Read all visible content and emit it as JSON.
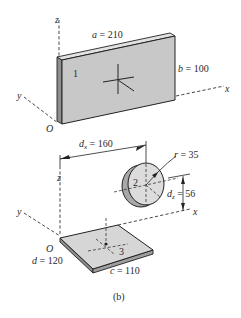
{
  "figure": {
    "caption": "(b)",
    "colors": {
      "plate_face": "#c8c8c8",
      "plate_edge": "#8e8e8e",
      "plate_top": "#e2e2e2",
      "disk_face": "#dcdcdc",
      "disk_rim": "#a8a8a8",
      "ink": "#222222"
    }
  },
  "top_view": {
    "axes": {
      "z": "z",
      "y": "y",
      "x": "x",
      "origin": "O"
    },
    "part_label": "1",
    "dim_a": {
      "var": "a",
      "eq": " = 210"
    },
    "dim_b": {
      "var": "b",
      "eq": " = 100"
    }
  },
  "bottom_view": {
    "axes": {
      "z": "z",
      "y": "y",
      "x": "x",
      "origin": "O"
    },
    "disk_label": "2",
    "plate_label": "3",
    "dim_dx": {
      "var": "d",
      "sub": "x",
      "eq": " = 160"
    },
    "dim_r": {
      "var": "r",
      "eq": " = 35"
    },
    "dim_dz": {
      "var": "d",
      "sub": "z",
      "eq": " = 56"
    },
    "dim_d": {
      "var": "d",
      "eq": " = 120"
    },
    "dim_c": {
      "var": "c",
      "eq": " = 110"
    }
  }
}
